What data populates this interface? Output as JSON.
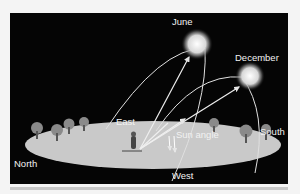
{
  "diagram": {
    "labels": {
      "june": "June",
      "december": "December",
      "east": "East",
      "west": "West",
      "north": "North",
      "south": "South",
      "sun_angle": "Sun angle"
    },
    "colors": {
      "background": "#050505",
      "ground": "#c9c9c9",
      "sun": "#e8e8e8",
      "path": "#e0e0e0",
      "tree": "#8a8a8a"
    }
  }
}
